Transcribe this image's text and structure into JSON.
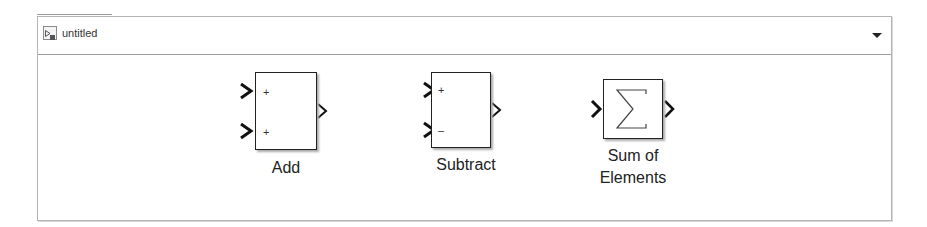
{
  "window": {
    "title": "untitled",
    "icon": "simulink-model-icon",
    "dropdown_icon": "triangle-down-icon"
  },
  "blocks": [
    {
      "name": "Add",
      "label": "Add",
      "inputs": [
        "+",
        "+"
      ],
      "outputs": 1
    },
    {
      "name": "Subtract",
      "label": "Subtract",
      "inputs": [
        "+",
        "–"
      ],
      "outputs": 1
    },
    {
      "name": "Sum of Elements",
      "label_line1": "Sum of",
      "label_line2": "Elements",
      "symbol": "Σ",
      "inputs": 1,
      "outputs": 1
    }
  ],
  "colors": {
    "border": "#b4b4b4",
    "block_stroke": "#222222",
    "background": "#ffffff"
  }
}
